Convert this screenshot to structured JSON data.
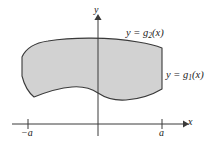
{
  "figure": {
    "background_color": "#ffffff",
    "region_fill_color": "#d2d2d2",
    "region_stroke_color": "#3a3a3a",
    "axis_color": "#3a3a3a"
  },
  "axes": {
    "x_axis_label": "x",
    "y_axis_label": "y",
    "x_axis_y_pixel": 124,
    "y_axis_x_pixel": 98,
    "ticks": [
      {
        "label": "−a",
        "name": "tick-negative-a",
        "x_pixel": 28
      },
      {
        "label": "a",
        "name": "tick-positive-a",
        "x_pixel": 162
      }
    ]
  },
  "curves": [
    {
      "name": "upper-boundary",
      "equation": "y = g₂(x)",
      "prefix": "y = g",
      "subscript": "2",
      "suffix": "(x)",
      "role": "upper"
    },
    {
      "name": "lower-boundary",
      "equation": "y = g₁(x)",
      "prefix": "y = g",
      "subscript": "1",
      "suffix": "(x)",
      "role": "lower"
    }
  ],
  "region": {
    "name": "shaded-region",
    "description": "Shaded area between g1 below and g2 above, from x = -a to x = a",
    "x_min_label": "−a",
    "x_max_label": "a"
  }
}
